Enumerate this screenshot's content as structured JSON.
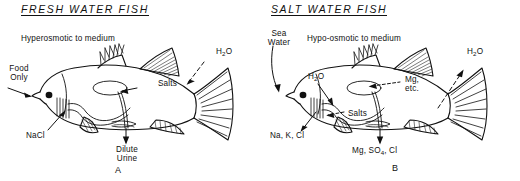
{
  "figure": {
    "ink_color": "#111111",
    "background_color": "#ffffff"
  },
  "panels": [
    {
      "id": "fresh",
      "title": "FRESH WATER FISH",
      "letter": "A",
      "osmotic_status": "Hyperosmotic to medium",
      "labels": {
        "intake": "Food\nOnly",
        "intake_line1": "Food",
        "intake_line2": "Only",
        "gill_exchange": "NaCl",
        "gut_absorption": "Salts",
        "water_flux": "H2O",
        "water_flux_display": "H",
        "water_flux_sub": "2",
        "water_flux_tail": "O",
        "excretion_line1": "Dilute",
        "excretion_line2": "Urine"
      }
    },
    {
      "id": "salt",
      "title": "SALT WATER FISH",
      "letter": "B",
      "osmotic_status": "Hypo-osmotic to medium",
      "labels": {
        "intake_line1": "Sea",
        "intake_line2": "Water",
        "gill_exchange": "Na, K, Cl",
        "gut_water": "H2O",
        "gut_water_display": "H",
        "gut_water_sub": "2",
        "gut_water_tail": "O",
        "gut_absorption": "Salts",
        "gut_rejected_line1": "Mg,",
        "gut_rejected_line2": "etc.",
        "water_flux": "H2O",
        "water_flux_display": "H",
        "water_flux_sub": "2",
        "water_flux_tail": "O",
        "excretion_prefix": "Mg, SO",
        "excretion_sub": "4",
        "excretion_suffix": ", Cl"
      }
    }
  ]
}
